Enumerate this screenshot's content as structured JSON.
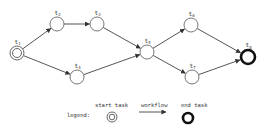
{
  "diagram": {
    "type": "workflow-graph",
    "label_note": "Node subscripts are inferred from graph structure; most digits were illegible in the source image.",
    "nodes": [
      {
        "id": "t1",
        "prefix": "t",
        "sub": "1",
        "kind": "start",
        "x": 17,
        "y": 53
      },
      {
        "id": "t2",
        "prefix": "t",
        "sub": "2",
        "kind": "task",
        "x": 57,
        "y": 24
      },
      {
        "id": "t3",
        "prefix": "t",
        "sub": "3",
        "kind": "task",
        "x": 97,
        "y": 24
      },
      {
        "id": "t4",
        "prefix": "t",
        "sub": "4",
        "kind": "task",
        "x": 77,
        "y": 77
      },
      {
        "id": "t5",
        "prefix": "t",
        "sub": "5",
        "kind": "task",
        "x": 147,
        "y": 52
      },
      {
        "id": "t6",
        "prefix": "t",
        "sub": "6",
        "kind": "task",
        "x": 191,
        "y": 25
      },
      {
        "id": "t7",
        "prefix": "t",
        "sub": "7",
        "kind": "task",
        "x": 192,
        "y": 77
      },
      {
        "id": "t8",
        "prefix": "t",
        "sub": "8",
        "kind": "end",
        "x": 248,
        "y": 57
      }
    ],
    "edges": [
      {
        "from": "t1",
        "to": "t2"
      },
      {
        "from": "t1",
        "to": "t4"
      },
      {
        "from": "t2",
        "to": "t3"
      },
      {
        "from": "t3",
        "to": "t5"
      },
      {
        "from": "t4",
        "to": "t5"
      },
      {
        "from": "t5",
        "to": "t6"
      },
      {
        "from": "t5",
        "to": "t7"
      },
      {
        "from": "t6",
        "to": "t8"
      },
      {
        "from": "t7",
        "to": "t8"
      }
    ]
  },
  "legend": {
    "title": "legend:",
    "start_label": "start task",
    "workflow_label": "workflow",
    "end_label": "end task"
  },
  "colors": {
    "edge": "#555555",
    "node_stroke": "#777777",
    "end_stroke": "#111111",
    "background": "#ffffff"
  }
}
